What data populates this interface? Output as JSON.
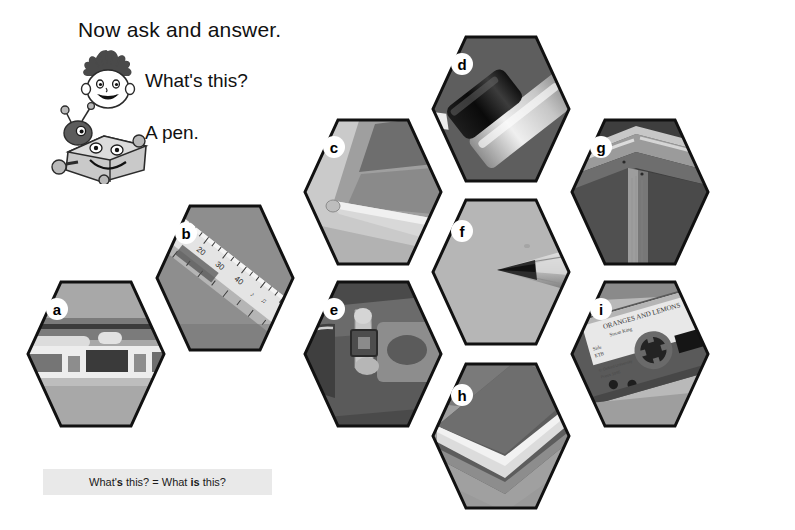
{
  "lesson": {
    "title": "Now ask and answer.",
    "question": "What's this?",
    "answer": "A pen.",
    "note_plain_1": "What'",
    "note_bold_1": "s",
    "note_plain_2": " this? = What ",
    "note_bold_2": "is",
    "note_plain_3": " this?",
    "note_full": "What's this? = What is this?"
  },
  "characters": [
    {
      "name": "boy-character",
      "description": "cartoon boy face with spiky hair"
    },
    {
      "name": "robot-character",
      "description": "cartoon smiling robot with antennae"
    }
  ],
  "colors": {
    "page_background": "#ffffff",
    "note_background": "#e9e9e9",
    "hex_outline": "#111111",
    "badge_background": "#ffffff",
    "badge_text": "#000000",
    "photo_light": "#d9d9d9",
    "photo_mid": "#9a9a9a",
    "photo_dark": "#4a4a4a"
  },
  "hexagons": [
    {
      "id": "a",
      "label": "a",
      "subject": "cassette-player",
      "left": 26,
      "top": 280
    },
    {
      "id": "b",
      "label": "b",
      "subject": "ruler",
      "left": 155,
      "top": 204
    },
    {
      "id": "c",
      "label": "c",
      "subject": "book",
      "left": 303,
      "top": 118
    },
    {
      "id": "d",
      "label": "d",
      "subject": "pen",
      "left": 431,
      "top": 35
    },
    {
      "id": "e",
      "label": "e",
      "subject": "bag",
      "left": 303,
      "top": 280
    },
    {
      "id": "f",
      "label": "f",
      "subject": "pencil",
      "left": 431,
      "top": 198
    },
    {
      "id": "g",
      "label": "g",
      "subject": "desk",
      "left": 570,
      "top": 118
    },
    {
      "id": "h",
      "label": "h",
      "subject": "eraser",
      "left": 431,
      "top": 362
    },
    {
      "id": "i",
      "label": "i",
      "subject": "cassette-tape",
      "left": 570,
      "top": 280
    }
  ],
  "ruler_marks": [
    "10",
    "20",
    "30",
    "40"
  ],
  "cassette_label": {
    "line1": "ORANGES AND LEMONS",
    "line2": "Susan King",
    "line3": "Side",
    "line4": "ETB"
  }
}
